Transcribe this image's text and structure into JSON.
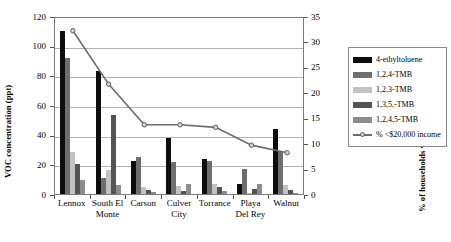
{
  "chart_data": {
    "type": "bar",
    "title": "",
    "xlabel": "",
    "ylabel": "VOC concentration (ppt)",
    "y2label": "% of households with income < $20,000",
    "ylim": [
      0,
      120
    ],
    "y2lim": [
      0,
      35
    ],
    "ytick_step": 20,
    "y2tick_step": 5,
    "grid": true,
    "legend_position": "right",
    "categories": [
      "Lennox",
      "South El Monte",
      "Carson",
      "Culver City",
      "Torrance",
      "Playa Del Rey",
      "Walnut"
    ],
    "yticks": [
      "0",
      "20",
      "40",
      "60",
      "80",
      "100",
      "120"
    ],
    "y2ticks": [
      "0",
      "5",
      "10",
      "15",
      "20",
      "25",
      "30",
      "35"
    ],
    "series": [
      {
        "name": "4-ethyltoluene",
        "color": "#0d0d0d",
        "axis": "left",
        "values": [
          110,
          83,
          22.5,
          38,
          23.5,
          7,
          44
        ]
      },
      {
        "name": "1,2,4-TMB",
        "color": "#6e6e6e",
        "axis": "left",
        "values": [
          92,
          11,
          25,
          21.5,
          22,
          17,
          29
        ]
      },
      {
        "name": "1,2,3-TMB",
        "color": "#c2c2c2",
        "axis": "left",
        "values": [
          28.5,
          16,
          5,
          5.5,
          7,
          1,
          6
        ]
      },
      {
        "name": "1,3,5,-TMB",
        "color": "#545454",
        "axis": "left",
        "values": [
          20,
          53,
          3,
          2,
          4.5,
          3.5,
          3
        ]
      },
      {
        "name": "1,2,4,5-TMB",
        "color": "#8c8c8c",
        "axis": "left",
        "values": [
          9.5,
          6,
          1.5,
          6.5,
          2,
          6.5,
          1
        ]
      },
      {
        "name": "% <$20,000 income",
        "color": "#6b6b6b",
        "axis": "right",
        "type": "line",
        "marker": "circle",
        "values": [
          32.5,
          22,
          14,
          14,
          13.5,
          10,
          8.5
        ]
      }
    ]
  },
  "axes": {
    "left_title": "VOC concentration (ppt)",
    "right_title": "% of households with income < $20,000"
  },
  "category_labels": [
    {
      "line1": "Lennox",
      "line2": ""
    },
    {
      "line1": "South El",
      "line2": "Monte"
    },
    {
      "line1": "Carson",
      "line2": ""
    },
    {
      "line1": "Culver",
      "line2": "City"
    },
    {
      "line1": "Torrance",
      "line2": ""
    },
    {
      "line1": "Playa",
      "line2": "Del Rey"
    },
    {
      "line1": "Walnut",
      "line2": ""
    }
  ],
  "legend": {
    "items": [
      {
        "label": "4-ethyltoluene",
        "color": "#0d0d0d",
        "kind": "bar"
      },
      {
        "label": "1,2,4-TMB",
        "color": "#6e6e6e",
        "kind": "bar"
      },
      {
        "label": "1,2,3-TMB",
        "color": "#c2c2c2",
        "kind": "bar"
      },
      {
        "label": "1,3,5,-TMB",
        "color": "#545454",
        "kind": "bar"
      },
      {
        "label": "1,2,4,5-TMB",
        "color": "#8c8c8c",
        "kind": "bar"
      },
      {
        "label": "% <$20,000 income",
        "color": "#6b6b6b",
        "kind": "line"
      }
    ]
  }
}
